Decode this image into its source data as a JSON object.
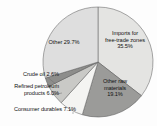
{
  "chart_data": {
    "type": "pie",
    "title": "",
    "subtitle": "",
    "xlabel": "",
    "ylabel": "",
    "legend_position": "none",
    "grid": false,
    "labels_position": "inside-and-outside",
    "categories": [
      "Imports for free-trade zones",
      "Other raw materials",
      "Consumer durables",
      "Refined petroleum products",
      "Crude oil",
      "Other"
    ],
    "values": [
      35.5,
      19.1,
      7.1,
      6.0,
      2.6,
      29.7
    ],
    "value_suffix": "%",
    "total": 100.0,
    "start_angle_deg": 0,
    "direction": "clockwise",
    "slices": [
      {
        "name": "imports-free-trade-zones",
        "label": "Imports for\nfree-trade zones\n35.5%",
        "category": "Imports for free-trade zones",
        "value": 35.5,
        "value_text": "35.5%",
        "color": "#e4e4e2",
        "stroke": "#6e6e6e",
        "label_placement": "inside",
        "start_deg": 0,
        "end_deg": 127.8
      },
      {
        "name": "other-raw-materials",
        "label": "Other raw\nmaterials\n19.1%",
        "category": "Other raw materials",
        "value": 19.1,
        "value_text": "19.1%",
        "color": "#9b9b99",
        "stroke": "#5d5d5d",
        "label_placement": "inside",
        "start_deg": 127.8,
        "end_deg": 196.6
      },
      {
        "name": "consumer-durables",
        "label": "Consumer durables 7.1%",
        "category": "Consumer durables",
        "value": 7.1,
        "value_text": "7.1%",
        "color": "#f4f4f2",
        "stroke": "#6e6e6e",
        "label_placement": "outside",
        "start_deg": 196.6,
        "end_deg": 222.1
      },
      {
        "name": "refined-petroleum-products",
        "label": "Refined petroleum\nproducts 6.0%",
        "category": "Refined petroleum products",
        "value": 6.0,
        "value_text": "6.0%",
        "color": "#c9c9c6",
        "stroke": "#6e6e6e",
        "label_placement": "outside",
        "start_deg": 222.1,
        "end_deg": 243.7
      },
      {
        "name": "crude-oil",
        "label": "Crude oil 2.6%",
        "category": "Crude oil",
        "value": 2.6,
        "value_text": "2.6%",
        "color": "#8d8d8b",
        "stroke": "#5d5d5d",
        "label_placement": "outside",
        "start_deg": 243.7,
        "end_deg": 253.0
      },
      {
        "name": "other",
        "label": "Other 29.7%",
        "category": "Other",
        "value": 29.7,
        "value_text": "29.7%",
        "color": "#dedede",
        "stroke": "#6e6e6e",
        "label_placement": "inside",
        "start_deg": 253.0,
        "end_deg": 360.0
      }
    ],
    "geometry": {
      "center_x": 98,
      "center_y": 62,
      "radius": 55
    },
    "colors": {
      "background": "#fdfdfd",
      "outline": "#6e6e6e",
      "text": "#111111"
    }
  }
}
